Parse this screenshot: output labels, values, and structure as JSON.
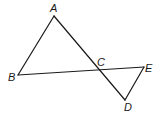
{
  "diagram": {
    "type": "geometry-figure",
    "points": {
      "A": {
        "label": "A",
        "x": 54,
        "y": 16,
        "lx": 50,
        "ly": 12
      },
      "B": {
        "label": "B",
        "x": 18,
        "y": 75,
        "lx": 8,
        "ly": 81
      },
      "C": {
        "label": "C",
        "x": 97,
        "y": 69,
        "lx": 97,
        "ly": 66
      },
      "D": {
        "label": "D",
        "x": 125,
        "y": 100,
        "lx": 124,
        "ly": 111
      },
      "E": {
        "label": "E",
        "x": 144,
        "y": 67,
        "lx": 145,
        "ly": 72
      }
    },
    "segments": [
      {
        "id": "AB",
        "from": "A",
        "to": "B"
      },
      {
        "id": "AD",
        "from": "A",
        "to": "D"
      },
      {
        "id": "BE",
        "from": "B",
        "to": "E"
      },
      {
        "id": "ED",
        "from": "E",
        "to": "D"
      }
    ],
    "colors": {
      "stroke": "#1a1a1a",
      "background": "#ffffff"
    }
  }
}
